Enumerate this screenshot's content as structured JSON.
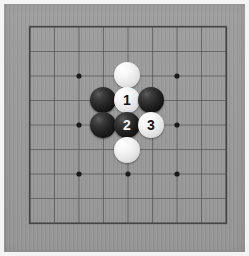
{
  "app": {
    "title": "Go Board Position",
    "canvas": {
      "width": 249,
      "height": 256
    }
  },
  "board": {
    "name": "go-board",
    "background_color": "#989898",
    "margin_color": "#f4f4f4",
    "line_color": "#4a4a4a",
    "border_color": "#3d3d3d",
    "size": 9,
    "origin_x": 30,
    "origin_y": 27,
    "spacing": 24.5,
    "star_point_label": "hoshi",
    "star_points": [
      {
        "col": 2,
        "row": 2
      },
      {
        "col": 4,
        "row": 2
      },
      {
        "col": 6,
        "row": 2
      },
      {
        "col": 2,
        "row": 4
      },
      {
        "col": 4,
        "row": 4
      },
      {
        "col": 6,
        "row": 4
      },
      {
        "col": 2,
        "row": 6
      },
      {
        "col": 4,
        "row": 6
      },
      {
        "col": 6,
        "row": 6
      }
    ]
  },
  "stones": [
    {
      "id": "stone-w-top",
      "color": "white",
      "label": "",
      "cx": 127,
      "cy": 75,
      "r": 13
    },
    {
      "id": "stone-b-left-1",
      "color": "black",
      "label": "",
      "cx": 103,
      "cy": 100,
      "r": 13
    },
    {
      "id": "stone-w-move-1",
      "color": "white",
      "label": "1",
      "cx": 127,
      "cy": 100,
      "r": 13
    },
    {
      "id": "stone-b-right-1",
      "color": "black",
      "label": "",
      "cx": 151,
      "cy": 100,
      "r": 13
    },
    {
      "id": "stone-b-left-2",
      "color": "black",
      "label": "",
      "cx": 103,
      "cy": 125,
      "r": 13
    },
    {
      "id": "stone-b-move-2",
      "color": "black",
      "label": "2",
      "cx": 127,
      "cy": 125,
      "r": 13
    },
    {
      "id": "stone-w-move-3",
      "color": "white",
      "label": "3",
      "cx": 151,
      "cy": 125,
      "r": 13
    },
    {
      "id": "stone-w-bottom",
      "color": "white",
      "label": "",
      "cx": 127,
      "cy": 150,
      "r": 13
    }
  ],
  "move_numbers": [
    "1",
    "2",
    "3"
  ]
}
